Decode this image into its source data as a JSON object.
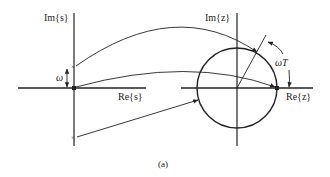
{
  "figure": {
    "caption": "(a)",
    "s_plane": {
      "im_label": "Im{s}",
      "re_label": "Re{s}",
      "omega_label": "ω",
      "pole_marker": "×"
    },
    "z_plane": {
      "im_label": "Im{z}",
      "re_label": "Re{z}",
      "angle_label": "ωT"
    }
  },
  "colors": {
    "ink": "#222222",
    "background": "#ffffff"
  }
}
